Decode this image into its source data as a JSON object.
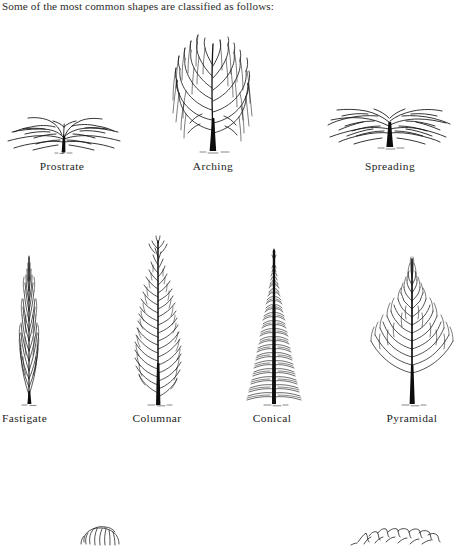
{
  "page": {
    "intro_text": "Some of the most common shapes are classified as follows:",
    "background_color": "#ffffff",
    "ink_color": "#111111"
  },
  "figure": {
    "rows": [
      {
        "row_index": 1,
        "trees": [
          {
            "label": "Prostrate",
            "shape": "prostrate",
            "label_center_x": 62,
            "label_top": 160
          },
          {
            "label": "Arching",
            "shape": "arching",
            "label_center_x": 213,
            "label_top": 160
          },
          {
            "label": "Spreading",
            "shape": "spreading",
            "label_center_x": 390,
            "label_top": 160
          }
        ]
      },
      {
        "row_index": 2,
        "trees": [
          {
            "label": "Fastigate",
            "shape": "fastigate",
            "label_center_x": 42,
            "label_top": 412
          },
          {
            "label": "Columnar",
            "shape": "columnar",
            "label_center_x": 157,
            "label_top": 412
          },
          {
            "label": "Conical",
            "shape": "conical",
            "label_center_x": 272,
            "label_top": 412
          },
          {
            "label": "Pyramidal",
            "shape": "pyramidal",
            "label_center_x": 412,
            "label_top": 412
          }
        ]
      },
      {
        "row_index": 3,
        "cut_off": true,
        "trees": [
          {
            "label": "",
            "shape": "rounded-partial",
            "label_center_x": 104,
            "label_top": 0
          },
          {
            "label": "",
            "shape": "sketch-partial",
            "label_center_x": 393,
            "label_top": 0
          }
        ]
      }
    ]
  }
}
